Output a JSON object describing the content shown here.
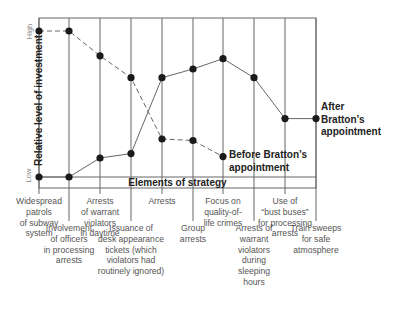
{
  "chart_data": {
    "type": "line",
    "title": "",
    "xlabel": "Elements of strategy",
    "ylabel": "Relative level of investment",
    "y_ticks": [
      "Low",
      "High"
    ],
    "categories": [
      "Widespread patrols of subway system",
      "Involvement of officers in processing arrests",
      "Arrests of warrant violators in daytime",
      "Issuance of desk appearance tickets (which violators had routinely ignored)",
      "Arrests",
      "Group arrests",
      "Focus on quality-of-life crimes",
      "Arrests of warrant violators during sleeping hours",
      "Use of \"bust buses\" for processing arrests",
      "Train sweeps for safe atmosphere"
    ],
    "series": [
      {
        "name": "Before Bratton's appointment",
        "style": "dashed",
        "values": [
          1.0,
          1.0,
          0.83,
          0.68,
          0.26,
          0.25,
          0.14,
          null,
          null,
          null
        ]
      },
      {
        "name": "After Bratton's appointment",
        "style": "solid",
        "values": [
          0.0,
          0.0,
          0.13,
          0.16,
          0.68,
          0.74,
          0.81,
          0.68,
          0.4,
          0.4
        ]
      }
    ],
    "ylim": [
      0,
      1
    ],
    "grid": "vertical lines at each category",
    "legend": "inline labels at series ends"
  },
  "labels": {
    "ylabel": "Relative level of investment",
    "ylow": "Low",
    "yhigh": "High",
    "xtitle": "Elements of strategy",
    "before": "Before Bratton’s\nappointment",
    "after": "After\nBratton’s\nappointment",
    "cats": [
      "Widespread\npatrols\nof subway\nsystem",
      "Involvement\nof officers\nin processing\narrests",
      "Arrests\nof warrant\nviolators\nin daytime",
      "Issuance of\ndesk appearance\ntickets (which\nviolators had\nroutinely ignored)",
      "Arrests",
      "Group\narrests",
      "Focus on\nquality-of-\nlife crimes",
      "Arrests of\nwarrant\nviolators\nduring\nsleeping\nhours",
      "Use of\n“bust buses”\nfor processing\narrests",
      "Train sweeps\nfor safe\natmosphere"
    ]
  }
}
